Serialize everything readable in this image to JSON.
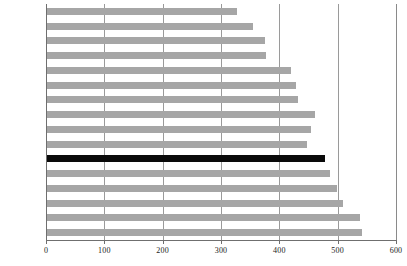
{
  "chart_data": {
    "type": "bar",
    "orientation": "horizontal",
    "title": "",
    "subtitle": "",
    "xlabel": "",
    "ylabel": "",
    "xlim": [
      0,
      600
    ],
    "ylim": null,
    "xticks": [
      0,
      100,
      200,
      300,
      400,
      500,
      600
    ],
    "xtick_labels": [
      "0",
      "100",
      "200",
      "300",
      "400",
      "500",
      "600"
    ],
    "grid": "vertical",
    "legend": null,
    "legend_position": "none",
    "categories": [
      "希腊",
      "丹麦",
      "爱尔兰",
      "荷兰",
      "葡萄牙",
      "芬兰",
      "英国",
      "西班牙",
      "瑞典",
      "比利时",
      "美国",
      "法国",
      "奥地利",
      "瑞士",
      "德国",
      "意大利"
    ],
    "values": [
      327,
      355,
      375,
      377,
      420,
      428,
      432,
      461,
      455,
      448,
      479,
      487,
      499,
      509,
      538,
      542
    ],
    "highlight_index": 10,
    "highlight_category": "美国",
    "colors": {
      "bar": "#a6a6a6",
      "bar_highlight": "#0a0a0a",
      "gridline": "#9a9a9a",
      "axis": "#6f6f6f",
      "text": "#111111",
      "background": "#ffffff"
    }
  }
}
